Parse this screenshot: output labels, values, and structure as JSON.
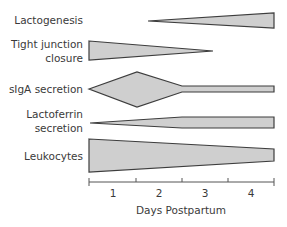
{
  "diagram": {
    "rows": [
      {
        "label_lines": [
          "Lactogenesis"
        ]
      },
      {
        "label_lines": [
          "Tight junction",
          "closure"
        ]
      },
      {
        "label_lines": [
          "sIgA secretion"
        ]
      },
      {
        "label_lines": [
          "Lactoferrin",
          "secretion"
        ]
      },
      {
        "label_lines": [
          "Leukocytes"
        ]
      }
    ],
    "x_axis": {
      "ticks": [
        "1",
        "2",
        "3",
        "4"
      ],
      "title": "Days Postpartum"
    },
    "colors": {
      "fill": "#cfcfcf",
      "stroke": "#3d3d3d",
      "text": "#3a3a3a"
    }
  }
}
